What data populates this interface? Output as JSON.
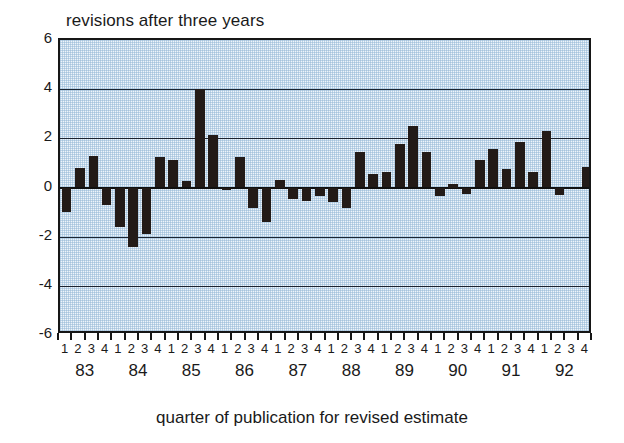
{
  "chart_data": {
    "type": "bar",
    "title": "revisions after three years",
    "xlabel": "quarter of publication for revised estimate",
    "ylabel": "",
    "ylim": [
      -6,
      6
    ],
    "yticks": [
      6,
      4,
      2,
      0,
      -2,
      -4,
      -6
    ],
    "ytick_labels": [
      "6",
      "4",
      "2",
      "0",
      "-2",
      "-4",
      "-6"
    ],
    "grid": true,
    "gridlines_at": [
      4,
      2,
      0,
      -2,
      -4
    ],
    "legend": null,
    "years": [
      "83",
      "84",
      "85",
      "86",
      "87",
      "88",
      "89",
      "90",
      "91",
      "92"
    ],
    "quarters": [
      "1",
      "2",
      "3",
      "4"
    ],
    "categories": [
      "83Q1",
      "83Q2",
      "83Q3",
      "83Q4",
      "84Q1",
      "84Q2",
      "84Q3",
      "84Q4",
      "85Q1",
      "85Q2",
      "85Q3",
      "85Q4",
      "86Q1",
      "86Q2",
      "86Q3",
      "86Q4",
      "87Q1",
      "87Q2",
      "87Q3",
      "87Q4",
      "88Q1",
      "88Q2",
      "88Q3",
      "88Q4",
      "89Q1",
      "89Q2",
      "89Q3",
      "89Q4",
      "90Q1",
      "90Q2",
      "90Q3",
      "90Q4",
      "91Q1",
      "91Q2",
      "91Q3",
      "91Q4",
      "92Q1",
      "92Q2",
      "92Q3",
      "92Q4"
    ],
    "values": [
      -1.0,
      0.8,
      1.3,
      -0.7,
      -1.6,
      -2.4,
      -1.9,
      1.25,
      1.1,
      0.25,
      4.0,
      2.15,
      -0.1,
      1.25,
      -0.85,
      -1.4,
      0.3,
      -0.45,
      -0.55,
      -0.35,
      -0.6,
      -0.85,
      1.45,
      0.55,
      0.65,
      1.75,
      2.5,
      1.45,
      -0.35,
      0.15,
      -0.25,
      1.1,
      1.55,
      0.75,
      1.85,
      0.65,
      2.3,
      -0.3,
      0.0,
      0.85
    ],
    "colors": {
      "bar": "#231b18",
      "plot_background": "#dce8f2",
      "axis": "#161616",
      "grid": "#1c2430",
      "text": "#1a1a1a"
    }
  }
}
